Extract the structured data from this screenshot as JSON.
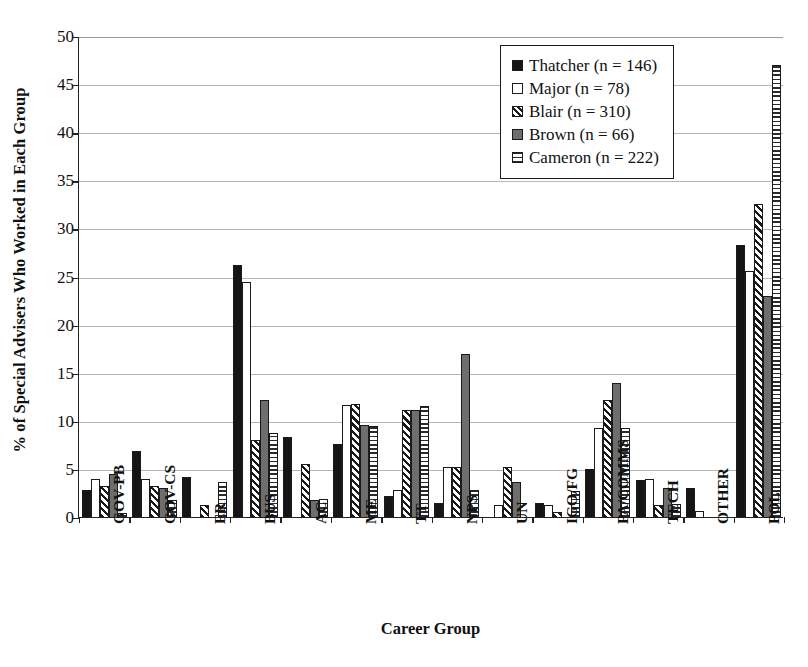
{
  "chart_data": {
    "type": "bar",
    "title": "",
    "xlabel": "Career Group",
    "ylabel": "% of Special Advisers Who Worked in Each Group",
    "ylim": [
      0,
      50
    ],
    "yticks": [
      0,
      5,
      10,
      15,
      20,
      25,
      30,
      35,
      40,
      45,
      50
    ],
    "grid": true,
    "legend_position": "top-right",
    "categories": [
      "GOV-PB",
      "GOV-CS",
      "ER",
      "BUS",
      "AC",
      "ME",
      "TT",
      "NPS",
      "UN",
      "IGO/FG",
      "PA/COMMS",
      "TECH",
      "OTHER",
      "POL"
    ],
    "series": [
      {
        "name": "Thatcher (n = 146)",
        "n": 146,
        "swatch": "solid-black",
        "values": [
          2.8,
          6.9,
          4.2,
          26.2,
          8.3,
          7.6,
          2.2,
          1.5,
          0.0,
          1.5,
          5.0,
          3.8,
          3.0,
          28.3
        ]
      },
      {
        "name": "Major (n = 78)",
        "n": 78,
        "swatch": "open-white",
        "values": [
          3.9,
          3.9,
          0.0,
          24.4,
          0.0,
          11.6,
          2.8,
          5.2,
          1.2,
          1.2,
          9.3,
          3.9,
          0.6,
          25.6
        ]
      },
      {
        "name": "Blair (n = 310)",
        "n": 310,
        "swatch": "diagonal-hatch",
        "values": [
          3.2,
          3.2,
          1.3,
          8.0,
          5.5,
          11.7,
          11.1,
          5.2,
          5.2,
          0.5,
          12.2,
          1.3,
          0.0,
          32.5
        ]
      },
      {
        "name": "Brown (n = 66)",
        "n": 66,
        "swatch": "solid-gray",
        "values": [
          4.5,
          3.0,
          0.0,
          12.2,
          1.8,
          9.6,
          11.1,
          16.9,
          3.6,
          0.0,
          13.9,
          3.0,
          0.0,
          23.0
        ]
      },
      {
        "name": "Cameron (n = 222)",
        "n": 222,
        "swatch": "horizontal-hatch",
        "values": [
          0.4,
          1.8,
          3.6,
          8.7,
          1.9,
          9.5,
          11.5,
          2.8,
          0.0,
          2.7,
          9.3,
          1.4,
          0.0,
          47.0
        ]
      }
    ]
  },
  "axis": {
    "y_title": "% of Special Advisers Who Worked in Each Group",
    "x_title": "Career Group"
  }
}
